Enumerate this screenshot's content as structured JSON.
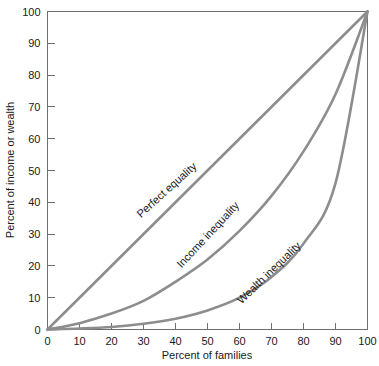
{
  "chart_data": {
    "type": "line",
    "title": "",
    "subtitle": "",
    "xlabel": "Percent of families",
    "ylabel": "Percent of income or wealth",
    "xlim": [
      0,
      100
    ],
    "ylim": [
      0,
      100
    ],
    "xticks": [
      0,
      10,
      20,
      30,
      40,
      50,
      60,
      70,
      80,
      90,
      100
    ],
    "yticks": [
      0,
      10,
      20,
      30,
      40,
      50,
      60,
      70,
      80,
      90,
      100
    ],
    "xtick_labels": [
      "0",
      "10",
      "20",
      "30",
      "40",
      "50",
      "60",
      "70",
      "80",
      "90",
      "100"
    ],
    "ytick_labels": [
      "0",
      "10",
      "20",
      "30",
      "40",
      "50",
      "60",
      "70",
      "80",
      "90",
      "100"
    ],
    "grid": false,
    "legend_position": "inline-curve-labels",
    "curve_color": "#8d8d8d",
    "axis_color": "#6e6e6e",
    "x": [
      0,
      10,
      20,
      30,
      40,
      50,
      60,
      70,
      80,
      90,
      100
    ],
    "series": [
      {
        "name": "Perfect equality",
        "label": "Perfect equality",
        "values": [
          0,
          10,
          20,
          30,
          40,
          50,
          60,
          70,
          80,
          90,
          100
        ],
        "label_x": 38,
        "label_y": 43,
        "label_rotation": -42
      },
      {
        "name": "Income inequality",
        "label": "Income inequality",
        "values": [
          0,
          2,
          5,
          9,
          15,
          22,
          31,
          42,
          56,
          74,
          100
        ],
        "label_x": 51,
        "label_y": 29,
        "label_rotation": -47
      },
      {
        "name": "Wealth inequality",
        "label": "Wealth inequality",
        "values": [
          0,
          0.3,
          0.8,
          1.8,
          3.4,
          6,
          10,
          16.5,
          27,
          46,
          100
        ],
        "label_x": 70,
        "label_y": 17,
        "label_rotation": -44
      }
    ]
  }
}
